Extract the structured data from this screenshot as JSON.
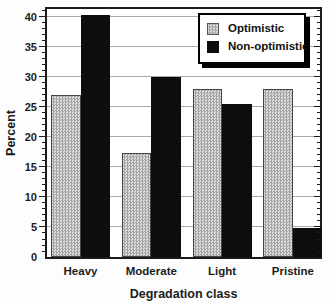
{
  "chart_data": {
    "type": "bar",
    "title": "",
    "xlabel": "Degradation class",
    "ylabel": "Percent",
    "categories": [
      "Heavy",
      "Moderate",
      "Light",
      "Pristine"
    ],
    "series": [
      {
        "name": "Optimistic",
        "style": "gray-hatch",
        "values": [
          27,
          17.3,
          28,
          28
        ]
      },
      {
        "name": "Non-optimistic",
        "style": "solid-black",
        "values": [
          40.3,
          30,
          25.5,
          4.9
        ]
      }
    ],
    "ylim": [
      0,
      41.3
    ],
    "yticks": [
      0,
      5,
      10,
      15,
      20,
      25,
      30,
      35,
      40
    ],
    "minor_tick_step": 1,
    "grid": "horizontal-major-gridlines",
    "legend_position": "top-right-inside"
  },
  "legend": {
    "items": [
      {
        "label": "Optimistic",
        "swatch": "gray-hatch"
      },
      {
        "label": "Non-optimistic",
        "swatch": "black"
      }
    ]
  },
  "colors": {
    "background": "#ffffff",
    "axis_frame": "#1b1b1b",
    "gridline": "#a9a9a9",
    "bar_black": "#0d0d0d",
    "bar_gray_dark": "#a4a4a4",
    "bar_gray_light": "#dedede",
    "legend_shadow": "#000000"
  }
}
